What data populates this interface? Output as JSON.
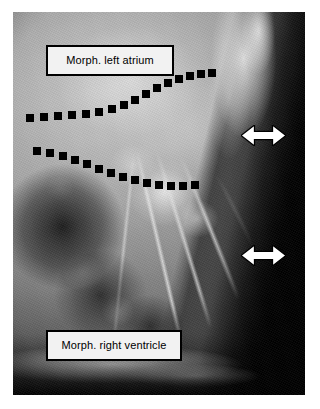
{
  "figure": {
    "kind": "gross-pathology-photograph",
    "color_mode": "grayscale",
    "background_color": "#ffffff",
    "plate_color": "#000000"
  },
  "labels": [
    {
      "id": "atrium",
      "text": "Morph. left atrium",
      "box_fill": "#f2f2f2",
      "box_border": "#000000",
      "text_color": "#000000"
    },
    {
      "id": "ventricle",
      "text": "Morph. right ventricle",
      "box_fill": "#f2f2f2",
      "box_border": "#000000",
      "text_color": "#000000"
    }
  ],
  "annotations": {
    "dashed_curves": [
      {
        "id": "upper-dashed-curve",
        "color": "#000000",
        "marker": "square",
        "marker_size_px": 8,
        "points": [
          [
            17,
            106
          ],
          [
            31,
            105
          ],
          [
            45,
            104
          ],
          [
            59,
            103
          ],
          [
            73,
            102
          ],
          [
            86,
            100
          ],
          [
            99,
            97
          ],
          [
            111,
            93
          ],
          [
            122,
            88
          ],
          [
            133,
            82
          ],
          [
            144,
            76
          ],
          [
            155,
            71
          ],
          [
            166,
            67
          ],
          [
            177,
            64
          ],
          [
            188,
            62
          ],
          [
            199,
            61
          ]
        ]
      },
      {
        "id": "lower-dashed-curve",
        "color": "#000000",
        "marker": "square",
        "marker_size_px": 8,
        "points": [
          [
            24,
            139
          ],
          [
            37,
            141
          ],
          [
            50,
            144
          ],
          [
            62,
            148
          ],
          [
            74,
            152
          ],
          [
            86,
            157
          ],
          [
            98,
            161
          ],
          [
            110,
            165
          ],
          [
            122,
            168
          ],
          [
            134,
            171
          ],
          [
            146,
            173
          ],
          [
            158,
            174
          ],
          [
            170,
            174
          ],
          [
            182,
            173
          ]
        ]
      }
    ],
    "arrows": [
      {
        "id": "arrow-upper",
        "style": "double-headed-horizontal",
        "fill": "#ffffff",
        "stroke": "#000000",
        "x": 228,
        "y": 113,
        "width": 45,
        "height": 21
      },
      {
        "id": "arrow-lower",
        "style": "double-headed-horizontal",
        "fill": "#ffffff",
        "stroke": "#000000",
        "x": 228,
        "y": 233,
        "width": 45,
        "height": 21
      }
    ]
  }
}
